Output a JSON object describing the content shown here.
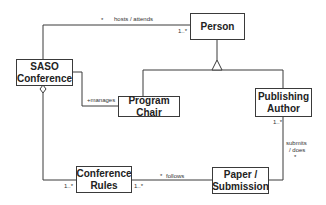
{
  "diagram": {
    "type": "UML class diagram",
    "classes": [
      {
        "id": "person",
        "name": "Person"
      },
      {
        "id": "saso",
        "name": "SASO Conference"
      },
      {
        "id": "program_chair",
        "name": "Program Chair"
      },
      {
        "id": "publishing_author",
        "name": "Publishing Author"
      },
      {
        "id": "conference_rules",
        "name": "Conference Rules"
      },
      {
        "id": "paper",
        "name": "Paper / Submission"
      }
    ],
    "labels": {
      "person": "Person",
      "saso_line1": "SASO",
      "saso_line2": "Conference",
      "chair_line1": "Program",
      "chair_line2": "Chair",
      "author_line1": "Publishing",
      "author_line2": "Author",
      "rules_line1": "Conference",
      "rules_line2": "Rules",
      "paper_line1": "Paper /",
      "paper_line2": "Submission"
    },
    "associations": {
      "hosts_attends": {
        "label": "hosts / attends",
        "src_mult": "*",
        "dst_mult": "1..*"
      },
      "manages": {
        "label": "+manages"
      },
      "follows": {
        "label": "follows",
        "src_mult": "*",
        "rules_left_mult": "1..*",
        "rules_right_mult": "1..*"
      },
      "submits": {
        "label_line1": "submits",
        "label_line2": "/ does",
        "src_mult": "1..*",
        "dst_mult": "*"
      }
    },
    "relationships": [
      {
        "from": "SASO Conference",
        "to": "Person",
        "kind": "association",
        "label": "hosts / attends"
      },
      {
        "from": "Program Chair",
        "to": "Person",
        "kind": "generalization"
      },
      {
        "from": "Publishing Author",
        "to": "Person",
        "kind": "generalization"
      },
      {
        "from": "SASO Conference",
        "to": "Program Chair",
        "kind": "association",
        "label": "+manages"
      },
      {
        "from": "SASO Conference",
        "to": "Conference Rules",
        "kind": "aggregation"
      },
      {
        "from": "Paper / Submission",
        "to": "Conference Rules",
        "kind": "association",
        "label": "follows"
      },
      {
        "from": "Publishing Author",
        "to": "Paper / Submission",
        "kind": "association",
        "label": "submits / does"
      }
    ]
  }
}
